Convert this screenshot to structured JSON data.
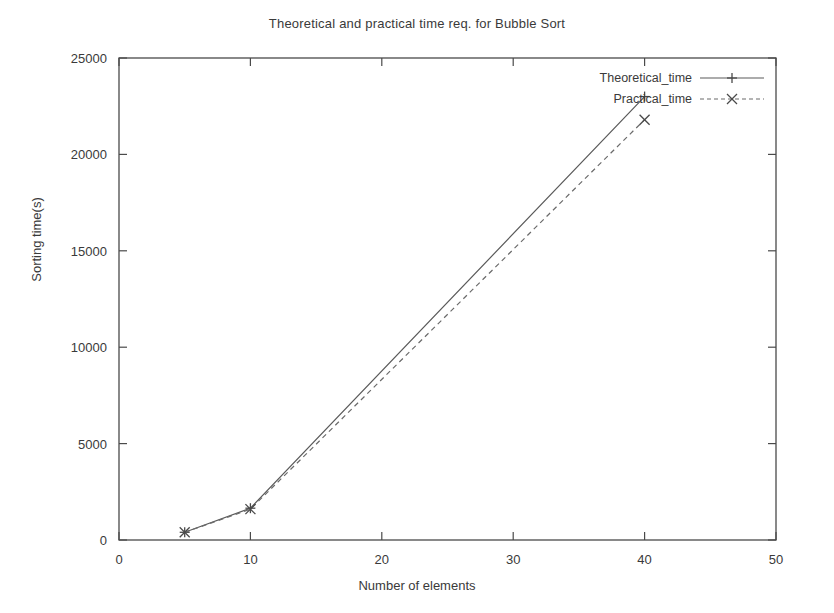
{
  "chart_data": {
    "type": "line",
    "title": "Theoretical and practical time req. for Bubble Sort",
    "xlabel": "Number of elements",
    "ylabel": "Sorting time(s)",
    "xlim": [
      0,
      50
    ],
    "ylim": [
      0,
      25000
    ],
    "xticks": [
      "0",
      "10",
      "20",
      "30",
      "40",
      "50"
    ],
    "xtick_values": [
      0,
      10,
      20,
      30,
      40,
      50
    ],
    "yticks": [
      "0",
      "5000",
      "10000",
      "15000",
      "20000",
      "25000"
    ],
    "ytick_values": [
      0,
      5000,
      10000,
      15000,
      20000,
      25000
    ],
    "grid": false,
    "legend_position": "top-right",
    "x": [
      5,
      10,
      40
    ],
    "series": [
      {
        "name": "Theoretical_time",
        "values": [
          400,
          1650,
          23000
        ],
        "linestyle": "solid",
        "marker": "plus",
        "color": "#5a5a5a"
      },
      {
        "name": "Practical_time",
        "values": [
          400,
          1600,
          21800
        ],
        "linestyle": "dashed",
        "marker": "cross",
        "color": "#6a6a6a"
      }
    ]
  },
  "legend": {
    "entries": [
      {
        "label": "Theoretical_time"
      },
      {
        "label": "Practical_time"
      }
    ]
  }
}
